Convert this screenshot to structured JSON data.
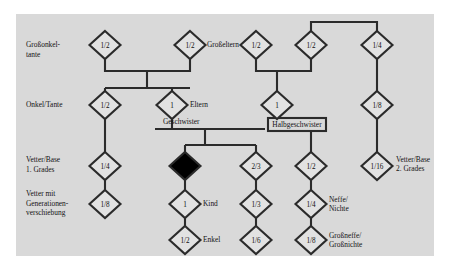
{
  "diagram": {
    "panel_color": "#d9d9d9",
    "line_color": "#2b2b2b",
    "node_fill": "#e2e2e2",
    "ego_fill": "#000000"
  },
  "row_labels": [
    {
      "id": "grossonkel",
      "line1": "Großonkel-",
      "line2": "tante"
    },
    {
      "id": "onkel",
      "line1": "Onkel/Tante",
      "line2": ""
    },
    {
      "id": "vetter1",
      "line1": "Vetter/Base",
      "line2": "1. Grades"
    },
    {
      "id": "vetter_gen",
      "line1": "Vetter mit",
      "line2": "Generationen-",
      "line3": "verschiebung"
    }
  ],
  "nodes": [
    {
      "id": "n-grossonkel",
      "value": "1/2",
      "x": 105,
      "y": 45,
      "filled": false
    },
    {
      "id": "n-grosseltern-left",
      "value": "1/2",
      "x": 190,
      "y": 45,
      "filled": false
    },
    {
      "id": "n-grosseltern-right",
      "value": "1/2",
      "x": 256,
      "y": 45,
      "filled": false
    },
    {
      "id": "n-stiefgrosseltern",
      "value": "1/2",
      "x": 311,
      "y": 45,
      "filled": false
    },
    {
      "id": "n-grossonkel-right",
      "value": "1/4",
      "x": 377,
      "y": 45,
      "filled": false
    },
    {
      "id": "n-onkel",
      "value": "1/2",
      "x": 105,
      "y": 105,
      "filled": false
    },
    {
      "id": "n-eltern",
      "value": "1",
      "x": 172,
      "y": 105,
      "filled": false
    },
    {
      "id": "n-stiefelternteil",
      "value": "1",
      "x": 277,
      "y": 105,
      "filled": false
    },
    {
      "id": "n-cousin-right-18",
      "value": "1/8",
      "x": 377,
      "y": 105,
      "filled": false
    },
    {
      "id": "n-vetter-14",
      "value": "1/4",
      "x": 105,
      "y": 166,
      "filled": false
    },
    {
      "id": "n-ego",
      "value": "",
      "x": 185,
      "y": 166,
      "filled": true
    },
    {
      "id": "n-halbgeschw-23",
      "value": "2/3",
      "x": 256,
      "y": 166,
      "filled": false
    },
    {
      "id": "n-geschwister-12",
      "value": "1/2",
      "x": 311,
      "y": 166,
      "filled": false
    },
    {
      "id": "n-vetter2-116",
      "value": "1/16",
      "x": 377,
      "y": 166,
      "filled": false
    },
    {
      "id": "n-vetter-18",
      "value": "1/8",
      "x": 105,
      "y": 204,
      "filled": false
    },
    {
      "id": "n-kind",
      "value": "1",
      "x": 185,
      "y": 204,
      "filled": false
    },
    {
      "id": "n-halbkind-13",
      "value": "1/3",
      "x": 256,
      "y": 204,
      "filled": false
    },
    {
      "id": "n-neffe",
      "value": "1/4",
      "x": 311,
      "y": 204,
      "filled": false
    },
    {
      "id": "n-enkel",
      "value": "1/2",
      "x": 185,
      "y": 240,
      "filled": false
    },
    {
      "id": "n-halbenkel-16",
      "value": "1/6",
      "x": 256,
      "y": 240,
      "filled": false
    },
    {
      "id": "n-grossneffe",
      "value": "1/8",
      "x": 311,
      "y": 240,
      "filled": false
    }
  ],
  "side_labels": [
    {
      "id": "lbl-grosseltern",
      "text": "Großeltern",
      "x": 207,
      "y": 47
    },
    {
      "id": "lbl-eltern",
      "text": "Eltern",
      "x": 190,
      "y": 107
    },
    {
      "id": "lbl-kind",
      "text": "Kind",
      "x": 203,
      "y": 206
    },
    {
      "id": "lbl-enkel",
      "text": "Enkel",
      "x": 203,
      "y": 242
    },
    {
      "id": "lbl-neffe-1",
      "text": "Neffe/",
      "x": 329,
      "y": 202
    },
    {
      "id": "lbl-neffe-2",
      "text": "Nichte",
      "x": 329,
      "y": 211
    },
    {
      "id": "lbl-grossneffe-1",
      "text": "Großneffe/",
      "x": 329,
      "y": 238
    },
    {
      "id": "lbl-grossneffe-2",
      "text": "Großnichte",
      "x": 329,
      "y": 247
    },
    {
      "id": "lbl-vetter2-1",
      "text": "Vetter/Base",
      "x": 396,
      "y": 162
    },
    {
      "id": "lbl-vetter2-2",
      "text": "2. Grades",
      "x": 396,
      "y": 171
    }
  ],
  "connector_labels": [
    {
      "id": "lbl-geschwister",
      "text": "Geschwister",
      "boxed": false,
      "x": 163,
      "y": 124
    },
    {
      "id": "lbl-halbgeschwister",
      "text": "Halbgeschwister",
      "boxed": true,
      "x": 268,
      "y": 118,
      "w": 58,
      "h": 13
    }
  ]
}
